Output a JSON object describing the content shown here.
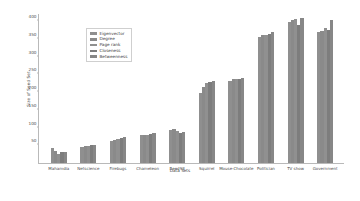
{
  "chart_data": {
    "type": "bar",
    "title": "",
    "xlabel": "Data Sets",
    "ylabel": "Size of Seed Set",
    "ylim": [
      0,
      420
    ],
    "yticks": [
      50,
      100,
      150,
      200,
      250,
      300,
      350,
      400
    ],
    "grid": false,
    "legend_position": "upper-left",
    "categories": [
      "Mahamdia",
      "Netscience",
      "Firebugs",
      "Chameleon",
      "Reed98",
      "Squirrel",
      "Mouse-Chocolate",
      "Politician",
      "TV show",
      "Government"
    ],
    "series": [
      {
        "name": "Eigenvector",
        "color": "#8f8f8f",
        "values": [
          42,
          46,
          62,
          78,
          92,
          196,
          232,
          356,
          398,
          368
        ]
      },
      {
        "name": "Degree",
        "color": "#8a8a8a",
        "values": [
          34,
          48,
          66,
          80,
          96,
          214,
          236,
          360,
          402,
          372
        ]
      },
      {
        "name": "Page rank",
        "color": "#909090",
        "values": [
          26,
          48,
          68,
          80,
          90,
          226,
          238,
          362,
          406,
          380
        ]
      },
      {
        "name": "Closeness",
        "color": "#7d7d7d",
        "values": [
          32,
          50,
          70,
          82,
          86,
          228,
          236,
          364,
          390,
          376
        ]
      },
      {
        "name": "Betweenness",
        "color": "#878787",
        "values": [
          30,
          50,
          72,
          84,
          88,
          232,
          240,
          368,
          408,
          404
        ]
      }
    ]
  }
}
